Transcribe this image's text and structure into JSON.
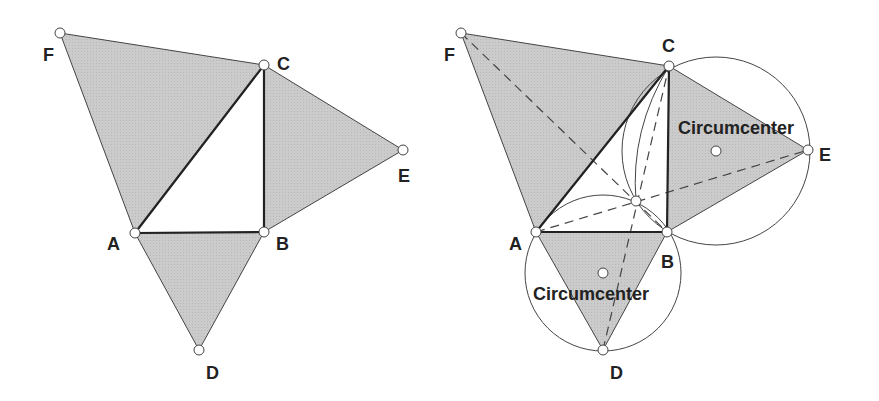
{
  "colors": {
    "fill": "#c8c8c8",
    "stroke": "#333333",
    "point": "#ffffff"
  },
  "left_figure": {
    "labels": {
      "A": "A",
      "B": "B",
      "C": "C",
      "D": "D",
      "E": "E",
      "F": "F"
    }
  },
  "right_figure": {
    "labels": {
      "A": "A",
      "B": "B",
      "C": "C",
      "D": "D",
      "E": "E",
      "F": "F"
    },
    "circumcenter_top_label": "Circumcenter",
    "circumcenter_bottom_label": "Circumcenter"
  }
}
